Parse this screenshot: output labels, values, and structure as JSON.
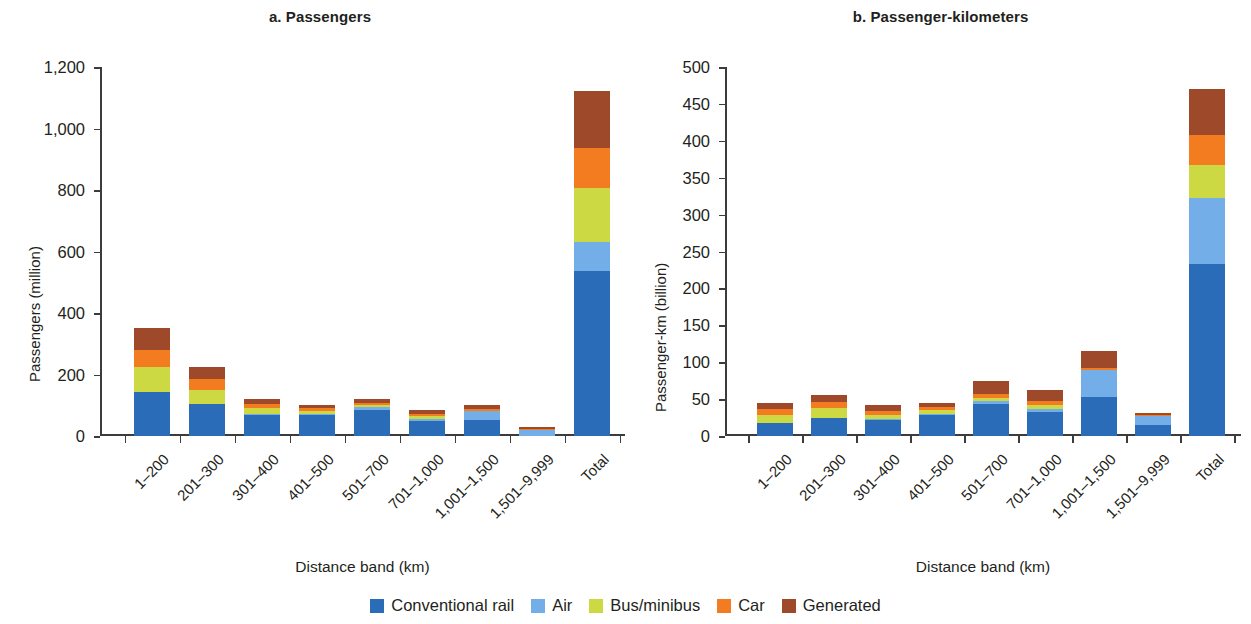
{
  "figure": {
    "legend": {
      "position": "bottom-center",
      "entries": [
        {
          "label": "Conventional rail",
          "color": "#2b6cb8"
        },
        {
          "label": "Air",
          "color": "#74aee8"
        },
        {
          "label": "Bus/minibus",
          "color": "#ccd943"
        },
        {
          "label": "Car",
          "color": "#f47c20"
        },
        {
          "label": "Generated",
          "color": "#9e4a2a"
        }
      ]
    }
  },
  "chart_data": [
    {
      "type": "bar",
      "subtype": "stacked",
      "panel": "a",
      "title": "a. Passengers",
      "xlabel": "Distance band (km)",
      "ylabel": "Passengers (million)",
      "ylim": [
        0,
        1200
      ],
      "yticks": [
        0,
        200,
        400,
        600,
        800,
        1000,
        1200
      ],
      "ytick_labels": [
        "0",
        "200",
        "400",
        "600",
        "800",
        "1,000",
        "1,200"
      ],
      "grid": false,
      "categories": [
        "1–200",
        "201–300",
        "301–400",
        "401–500",
        "501–700",
        "701–1,000",
        "1,001–1,500",
        "1,501–9,999",
        "Total"
      ],
      "series": [
        {
          "name": "Conventional rail",
          "color": "#2b6cb8",
          "values": [
            142,
            103,
            70,
            68,
            85,
            50,
            52,
            0,
            537
          ]
        },
        {
          "name": "Air",
          "color": "#74aee8",
          "values": [
            0,
            0,
            3,
            3,
            8,
            6,
            30,
            22,
            93
          ]
        },
        {
          "name": "Bus/minibus",
          "color": "#ccd943",
          "values": [
            83,
            47,
            17,
            11,
            7,
            10,
            0,
            0,
            175
          ]
        },
        {
          "name": "Car",
          "color": "#f47c20",
          "values": [
            55,
            37,
            13,
            8,
            8,
            7,
            5,
            2,
            133
          ]
        },
        {
          "name": "Generated",
          "color": "#9e4a2a",
          "values": [
            72,
            36,
            17,
            12,
            14,
            11,
            14,
            4,
            185
          ]
        }
      ],
      "totals": [
        352,
        223,
        120,
        102,
        122,
        84,
        101,
        28,
        1123
      ]
    },
    {
      "type": "bar",
      "subtype": "stacked",
      "panel": "b",
      "title": "b. Passenger-kilometers",
      "xlabel": "Distance band (km)",
      "ylabel": "Passenger-km (billion)",
      "ylim": [
        0,
        500
      ],
      "yticks": [
        0,
        50,
        100,
        150,
        200,
        250,
        300,
        350,
        400,
        450,
        500
      ],
      "ytick_labels": [
        "0",
        "50",
        "100",
        "150",
        "200",
        "250",
        "300",
        "350",
        "400",
        "450",
        "500"
      ],
      "grid": false,
      "categories": [
        "1–200",
        "201–300",
        "301–400",
        "401–500",
        "501–700",
        "701–1,000",
        "1,001–1,500",
        "1,501–9,999",
        "Total"
      ],
      "series": [
        {
          "name": "Conventional rail",
          "color": "#2b6cb8",
          "values": [
            17,
            25,
            22,
            29,
            44,
            32,
            53,
            15,
            233
          ]
        },
        {
          "name": "Air",
          "color": "#74aee8",
          "values": [
            0,
            0,
            1,
            1,
            4,
            4,
            37,
            13,
            90
          ]
        },
        {
          "name": "Bus/minibus",
          "color": "#ccd943",
          "values": [
            11,
            13,
            6,
            5,
            4,
            6,
            0,
            0,
            44
          ]
        },
        {
          "name": "Car",
          "color": "#f47c20",
          "values": [
            8,
            8,
            5,
            4,
            5,
            5,
            2,
            1,
            41
          ]
        },
        {
          "name": "Generated",
          "color": "#9e4a2a",
          "values": [
            9,
            9,
            8,
            6,
            17,
            15,
            23,
            2,
            62
          ]
        }
      ],
      "totals": [
        45,
        55,
        42,
        45,
        74,
        62,
        115,
        31,
        470
      ]
    }
  ]
}
